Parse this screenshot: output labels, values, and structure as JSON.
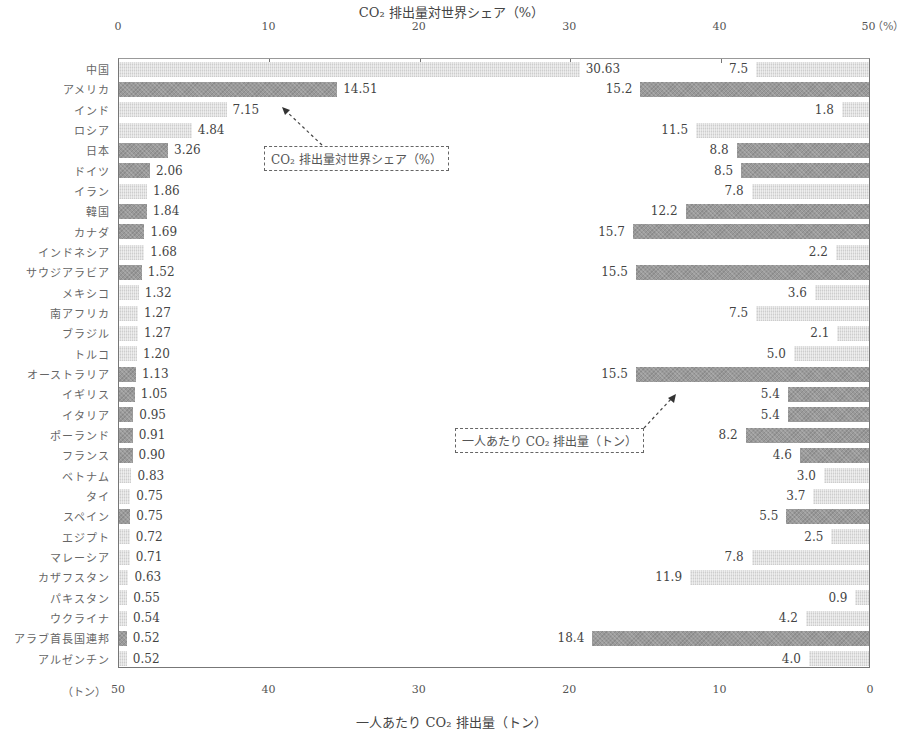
{
  "chart_data": {
    "type": "bar",
    "layout": "back-to-back horizontal bar",
    "title_top": "CO₂排出量対世界シェア（%）",
    "title_bottom": "一人あたり CO₂ 排出量（トン）",
    "top_axis": {
      "label": "CO₂排出量対世界シェア（%）",
      "range": [
        0,
        50
      ],
      "ticks": [
        "0",
        "10",
        "20",
        "30",
        "40",
        "50"
      ],
      "unit": "（%）",
      "direction": "left-to-right"
    },
    "bottom_axis": {
      "label": "一人あたり CO₂ 排出量（トン）",
      "range": [
        50,
        0
      ],
      "ticks": [
        "50",
        "40",
        "30",
        "20",
        "10",
        "0"
      ],
      "unit": "（トン）",
      "direction": "right-to-left"
    },
    "grid": false,
    "categories": [
      "中国",
      "アメリカ",
      "インド",
      "ロシア",
      "日本",
      "ドイツ",
      "イラン",
      "韓国",
      "カナダ",
      "インドネシア",
      "サウジアラビア",
      "メキシコ",
      "南アフリカ",
      "ブラジル",
      "トルコ",
      "オーストラリア",
      "イギリス",
      "イタリア",
      "ポーランド",
      "フランス",
      "ベトナム",
      "タイ",
      "スペイン",
      "エジプト",
      "マレーシア",
      "カザフスタン",
      "パキスタン",
      "ウクライナ",
      "アラブ首長国連邦",
      "アルゼンチン"
    ],
    "series": [
      {
        "name": "CO₂排出量対世界シェア（%）",
        "values": [
          30.63,
          14.51,
          7.15,
          4.84,
          3.26,
          2.06,
          1.86,
          1.84,
          1.69,
          1.68,
          1.52,
          1.32,
          1.27,
          1.27,
          1.2,
          1.13,
          1.05,
          0.95,
          0.91,
          0.9,
          0.83,
          0.75,
          0.75,
          0.72,
          0.71,
          0.63,
          0.55,
          0.54,
          0.52,
          0.52
        ],
        "labels": [
          "30.63",
          "14.51",
          "7.15",
          "4.84",
          "3.26",
          "2.06",
          "1.86",
          "1.84",
          "1.69",
          "1.68",
          "1.52",
          "1.32",
          "1.27",
          "1.27",
          "1.20",
          "1.13",
          "1.05",
          "0.95",
          "0.91",
          "0.90",
          "0.83",
          "0.75",
          "0.75",
          "0.72",
          "0.71",
          "0.63",
          "0.55",
          "0.54",
          "0.52",
          "0.52"
        ]
      },
      {
        "name": "一人あたり CO₂ 排出量（トン）",
        "values": [
          7.5,
          15.2,
          1.8,
          11.5,
          8.8,
          8.5,
          7.8,
          12.2,
          15.7,
          2.2,
          15.5,
          3.6,
          7.5,
          2.1,
          5.0,
          15.5,
          5.4,
          5.4,
          8.2,
          4.6,
          3.0,
          3.7,
          5.5,
          2.5,
          7.8,
          11.9,
          0.9,
          4.2,
          18.4,
          4.0
        ],
        "labels": [
          "7.5",
          "15.2",
          "1.8",
          "11.5",
          "8.8",
          "8.5",
          "7.8",
          "12.2",
          "15.7",
          "2.2",
          "15.5",
          "3.6",
          "7.5",
          "2.1",
          "5.0",
          "15.5",
          "5.4",
          "5.4",
          "8.2",
          "4.6",
          "3.0",
          "3.7",
          "5.5",
          "2.5",
          "7.8",
          "11.9",
          "0.9",
          "4.2",
          "18.4",
          "4.0"
        ]
      }
    ],
    "shading": [
      "light",
      "dark",
      "light",
      "light",
      "dark",
      "dark",
      "light",
      "dark",
      "dark",
      "light",
      "dark",
      "light",
      "light",
      "light",
      "light",
      "dark",
      "dark",
      "dark",
      "dark",
      "dark",
      "light",
      "light",
      "dark",
      "light",
      "light",
      "light",
      "light",
      "light",
      "dark",
      "light"
    ],
    "annotations": [
      {
        "text": "CO₂ 排出量対世界シェア（%）",
        "style": "dashed box with arrow"
      },
      {
        "text": "一人あたり CO₂ 排出量（トン）",
        "style": "dashed box with arrow"
      }
    ],
    "legend": "none (callout annotations)"
  },
  "labels": {
    "top_title": "CO₂ 排出量対世界シェア（%）",
    "bottom_title": "一人あたり CO₂ 排出量（トン）",
    "top_unit": "（%）",
    "bottom_unit": "（トン）",
    "callout_share": "CO₂ 排出量対世界シェア（%）",
    "callout_percap": "一人あたり CO₂ 排出量（トン）"
  }
}
